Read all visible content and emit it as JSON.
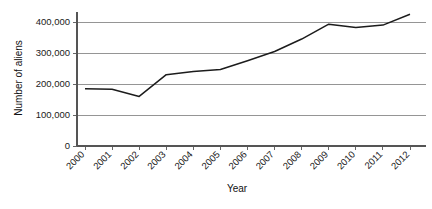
{
  "chart_data": {
    "type": "line",
    "title": "",
    "xlabel": "Year",
    "ylabel": "Number of aliens",
    "categories": [
      "2000",
      "2001",
      "2002",
      "2003",
      "2004",
      "2005",
      "2006",
      "2007",
      "2008",
      "2009",
      "2010",
      "2011",
      "2012"
    ],
    "values": [
      185000,
      183000,
      160000,
      230000,
      240000,
      247000,
      275000,
      305000,
      345000,
      393000,
      382000,
      390000,
      425000
    ],
    "series": [
      {
        "name": "Number of aliens",
        "values": [
          185000,
          183000,
          160000,
          230000,
          240000,
          247000,
          275000,
          305000,
          345000,
          393000,
          382000,
          390000,
          425000
        ]
      }
    ],
    "ylim": [
      0,
      450000
    ],
    "ytick_values": [
      0,
      100000,
      200000,
      300000,
      400000
    ],
    "ytick_labels": [
      "0",
      "100,000",
      "200,000",
      "300,000",
      "400,000"
    ],
    "grid": true,
    "grid_axis": "y",
    "legend": false,
    "legend_position": "none",
    "xtick_rotation": 45,
    "line_color": "#1c1c1c",
    "grid_color": "#8a8a8a",
    "axis_color": "#555555",
    "background_color": "#ffffff",
    "text_color": "#1a1a1a"
  }
}
